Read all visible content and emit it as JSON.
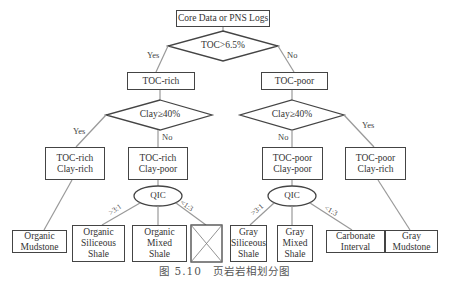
{
  "diagram": {
    "root": "Core Data or PNS Logs",
    "decision_toc": "TOC>6.5%",
    "branch_yes": "Yes",
    "branch_no": "No",
    "toc_rich": "TOC-rich",
    "toc_poor": "TOC-poor",
    "decision_clay_left": "Clay≥40%",
    "decision_clay_right": "Clay≥40%",
    "left": {
      "clay_rich": [
        "TOC-rich",
        "Clay-rich"
      ],
      "clay_poor": [
        "TOC-rich",
        "Clay-poor"
      ],
      "qic": "QIC",
      "ratio_high": ">3:1",
      "ratio_low": "<1:3",
      "mudstone": [
        "Organic",
        "Mudstone"
      ],
      "siliceous": [
        "Organic",
        "Siliceous",
        "Shale"
      ],
      "mixed": [
        "Organic",
        "Mixed",
        "Shale"
      ],
      "empty": "crossed-box"
    },
    "right": {
      "clay_poor": [
        "TOC-poor",
        "Clay-poor"
      ],
      "clay_rich": [
        "TOC-poor",
        "Clay-rich"
      ],
      "qic": "QIC",
      "ratio_high": ">3:1",
      "ratio_low": "<1:3",
      "siliceous": [
        "Gray",
        "Siliceous",
        "Shale"
      ],
      "mixed": [
        "Gray",
        "Mixed",
        "Shale"
      ],
      "carbonate": [
        "Carbonate",
        "Interval"
      ],
      "mudstone": [
        "Gray",
        "Mudstone"
      ]
    }
  },
  "caption": "图 5.10　页岩岩相划分图"
}
